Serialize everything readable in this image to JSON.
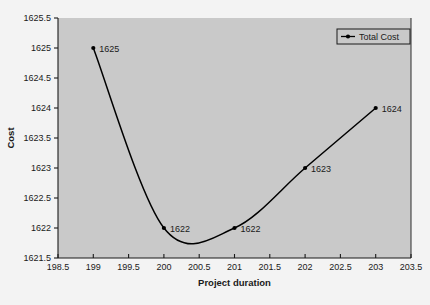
{
  "chart_data": {
    "type": "line",
    "title": "",
    "xlabel": "Project duration",
    "ylabel": "Cost",
    "xlim": [
      198.5,
      203.5
    ],
    "ylim": [
      1621.5,
      1625.5
    ],
    "grid": false,
    "legend_position": "top-right",
    "x_ticks": [
      "198.5",
      "199",
      "199.5",
      "200",
      "200.5",
      "201",
      "201.5",
      "202",
      "202.5",
      "203",
      "203.5"
    ],
    "x_tick_values": [
      198.5,
      199,
      199.5,
      200,
      200.5,
      201,
      201.5,
      202,
      202.5,
      203,
      203.5
    ],
    "y_ticks": [
      "1621.5",
      "1622",
      "1622.5",
      "1623",
      "1623.5",
      "1624",
      "1624.5",
      "1625",
      "1625.5"
    ],
    "y_tick_values": [
      1621.5,
      1622,
      1622.5,
      1623,
      1623.5,
      1624,
      1624.5,
      1625,
      1625.5
    ],
    "series": [
      {
        "name": "Total Cost",
        "color": "#000000",
        "marker": "filled-dot",
        "smooth": true,
        "x": [
          199,
          200,
          201,
          202,
          203
        ],
        "values": [
          1625,
          1622,
          1622,
          1623,
          1624
        ],
        "point_labels": [
          "1625",
          "1622",
          "1622",
          "1623",
          "1624"
        ]
      }
    ],
    "legend": [
      {
        "label": "Total Cost",
        "color": "#000000"
      }
    ],
    "plot_background": "#c9c9c9",
    "figure_background": "#f3f3f3",
    "axis_color": "#1a1a1a"
  }
}
